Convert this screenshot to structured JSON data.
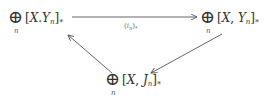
{
  "nodes": {
    "left": {
      "sum_symbol": "⊕",
      "index": "n",
      "open": "[",
      "X": "X",
      "sep": ".",
      "Y": "Y",
      "sub": "n",
      "close": "]",
      "star": "*"
    },
    "right": {
      "sum_symbol": "⊕",
      "index": "n",
      "open": "[",
      "X": "X",
      "sep": ", ",
      "Y": "Y",
      "sub": "n",
      "close": "]",
      "star": "*"
    },
    "bottom": {
      "sum_symbol": "⊕",
      "index": "n",
      "open": "[",
      "X": "X",
      "sep": ", ",
      "Y": "J",
      "sub": "n",
      "close": "]",
      "star": "*"
    }
  },
  "arrows": {
    "top": {
      "label_open": "(",
      "label_i": "i",
      "label_sub": "n",
      "label_close": ")",
      "label_star": "*"
    }
  },
  "colors": {
    "line": "#555555",
    "text": "#333333"
  }
}
